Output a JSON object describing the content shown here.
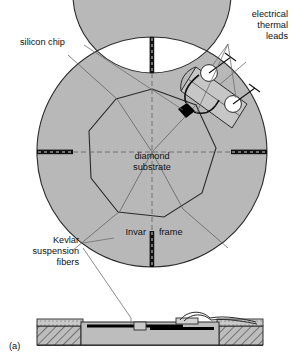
{
  "figure": {
    "panel_label": "(a)",
    "labels": {
      "silicon_chip": "silicon chip",
      "electrical_leads_line1": "electrical",
      "electrical_leads_line2": "thermal",
      "electrical_leads_line3": "leads",
      "diamond_substrate_line1": "diamond",
      "diamond_substrate_line2": "substrate",
      "invar_frame_left": "Invar",
      "invar_frame_right": "frame",
      "kevlar_line1": "Kevlar",
      "kevlar_line2": "suspension",
      "kevlar_line3": "fibers"
    },
    "colors": {
      "fill_gray": "#b8b8b8",
      "fill_gray_light": "#c6c6c6",
      "fill_gray_dark": "#9a9a9a",
      "outline": "#2b2b2b",
      "chip_black": "#000000",
      "background": "#ffffff",
      "leader_line": "#6f6f6f",
      "hatch": "#3a3a3a"
    },
    "geometry": {
      "ring_center_x": 152,
      "ring_center_y": 152,
      "ring_outer_radius": 115,
      "ring_inner_radius": 79,
      "polygon_radius": 63,
      "polygon_sides": 8,
      "gap_angles_deg": [
        0,
        90,
        180,
        270
      ],
      "cross_section_top_y": 318,
      "cross_section_bottom_y": 345
    },
    "leads": [
      {
        "name": "lead-upper",
        "cx": 209,
        "cy": 73
      },
      {
        "name": "lead-lower",
        "cx": 233,
        "cy": 104
      }
    ]
  }
}
